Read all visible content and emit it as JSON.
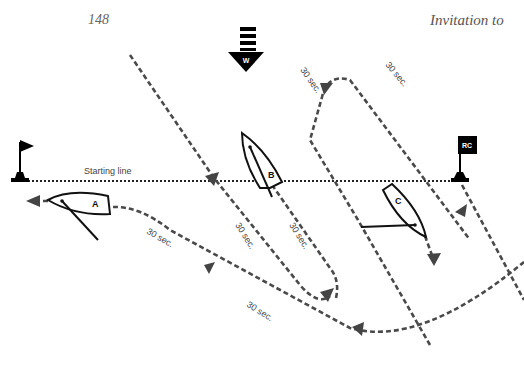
{
  "header": {
    "page_number": "148",
    "running_head": "Invitation to"
  },
  "diagram": {
    "wind_label": "W",
    "starting_line_label": "Starting line",
    "committee_boat_label": "RC",
    "boats": [
      {
        "label": "A"
      },
      {
        "label": "B"
      },
      {
        "label": "C"
      }
    ],
    "timing_labels": [
      "30 sec.",
      "30 sec.",
      "30 sec.",
      "30 sec.",
      "30 sec.",
      "30 sec.",
      "30 sec."
    ],
    "colors": {
      "path": "#4a4a4a",
      "boat_outline": "#111111",
      "flag": "#000000"
    }
  }
}
